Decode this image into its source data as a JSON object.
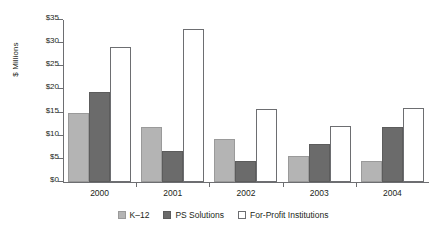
{
  "chart_data": {
    "type": "bar",
    "title": "",
    "xlabel": "",
    "ylabel": "$ Millions",
    "ylim": [
      0,
      35
    ],
    "ytick_step": 5,
    "ytick_labels": [
      "$0",
      "$5",
      "$10",
      "$15",
      "$20",
      "$25",
      "$30",
      "$35"
    ],
    "grid": false,
    "legend_position": "bottom-center",
    "categories": [
      "2000",
      "2001",
      "2002",
      "2003",
      "2004"
    ],
    "series": [
      {
        "name": "K–12",
        "color": "#b4b4b4",
        "values": [
          15.0,
          11.8,
          9.4,
          5.6,
          4.6
        ]
      },
      {
        "name": "PS Solutions",
        "color": "#6b6b6b",
        "values": [
          19.5,
          6.7,
          4.6,
          8.3,
          11.9
        ]
      },
      {
        "name": "For-Profit Institutions",
        "color": "#ffffff",
        "values": [
          29.1,
          33.0,
          15.8,
          12.2,
          15.9
        ]
      }
    ]
  },
  "axis": {
    "label_color": "#231f20",
    "line_color": "#6d6e71"
  }
}
